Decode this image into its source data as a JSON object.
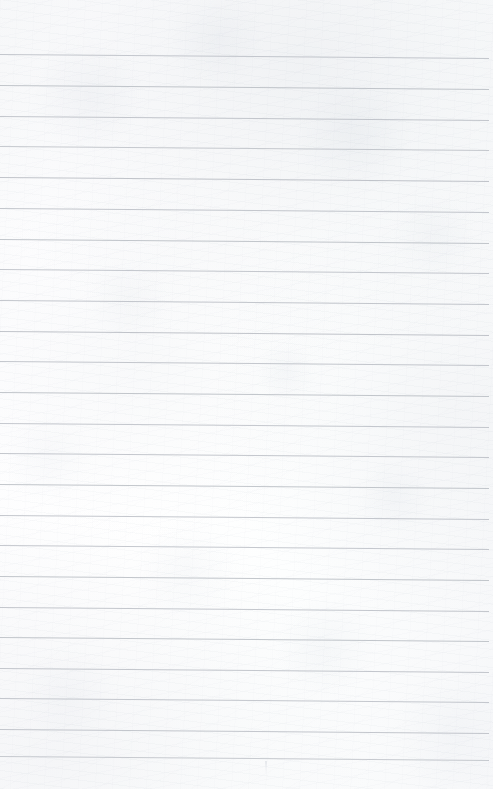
{
  "document": {
    "kind": "lined-notepad-page",
    "title": "Blank Ruled Notepad Sheet",
    "page_width": 493,
    "page_height": 789,
    "content_text": "",
    "has_handwriting": false,
    "has_margin_rule": false
  },
  "paper": {
    "background_color": "#fdfdfe",
    "base_tint_color": "#f7f8fa",
    "edge_shadow_color": "#e9ebef",
    "texture": "subtle-scan-grain"
  },
  "ruling": {
    "line_color": "#b5b9c0",
    "line_color_light": "#c8ccd2",
    "line_thickness_px": 1,
    "spacing_px": 30.7,
    "first_line_y": 54,
    "line_count": 24,
    "left_inset_px": 0,
    "right_inset_px": 4,
    "tilt_drop_px": 4,
    "lines": [
      {
        "index": 1,
        "y": 54,
        "opacity": 0.78
      },
      {
        "index": 2,
        "y": 85,
        "opacity": 0.82
      },
      {
        "index": 3,
        "y": 116,
        "opacity": 0.8
      },
      {
        "index": 4,
        "y": 146,
        "opacity": 0.76
      },
      {
        "index": 5,
        "y": 177,
        "opacity": 0.84
      },
      {
        "index": 6,
        "y": 208,
        "opacity": 0.8
      },
      {
        "index": 7,
        "y": 239,
        "opacity": 0.82
      },
      {
        "index": 8,
        "y": 269,
        "opacity": 0.78
      },
      {
        "index": 9,
        "y": 300,
        "opacity": 0.8
      },
      {
        "index": 10,
        "y": 331,
        "opacity": 0.84
      },
      {
        "index": 11,
        "y": 361,
        "opacity": 0.8
      },
      {
        "index": 12,
        "y": 392,
        "opacity": 0.82
      },
      {
        "index": 13,
        "y": 423,
        "opacity": 0.78
      },
      {
        "index": 14,
        "y": 453,
        "opacity": 0.8
      },
      {
        "index": 15,
        "y": 484,
        "opacity": 0.82
      },
      {
        "index": 16,
        "y": 515,
        "opacity": 0.8
      },
      {
        "index": 17,
        "y": 545,
        "opacity": 0.78
      },
      {
        "index": 18,
        "y": 576,
        "opacity": 0.82
      },
      {
        "index": 19,
        "y": 607,
        "opacity": 0.8
      },
      {
        "index": 20,
        "y": 637,
        "opacity": 0.82
      },
      {
        "index": 21,
        "y": 668,
        "opacity": 0.8
      },
      {
        "index": 22,
        "y": 698,
        "opacity": 0.78
      },
      {
        "index": 23,
        "y": 729,
        "opacity": 0.8
      },
      {
        "index": 24,
        "y": 756,
        "opacity": 0.74
      }
    ]
  },
  "margins": {
    "top_blank_px": 54,
    "bottom_blank_px": 33
  },
  "artifacts": [
    {
      "name": "faint-vertical-smudge",
      "x": 265,
      "y": 761,
      "width": 2,
      "height": 13
    }
  ]
}
